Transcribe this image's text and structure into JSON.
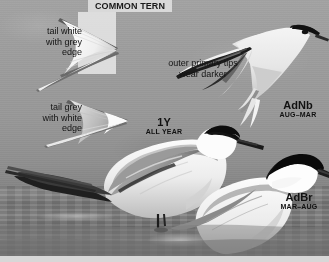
{
  "plate": {
    "title": "COMMON TERN",
    "subject": "Common Tern identification plate",
    "palette": {
      "sky": "#9d9d9d",
      "water": "#7a7a7a",
      "title_band": "#d9d9d9",
      "text": "#141414",
      "bottom_strip": "#d7d7d7"
    }
  },
  "annotations": [
    {
      "id": "tail-white-grey-edge",
      "text": "tail white\nwith grey\nedge",
      "align": "right"
    },
    {
      "id": "tail-grey-white-edge",
      "text": "tail grey\nwith white\nedge",
      "align": "right"
    },
    {
      "id": "outer-primary-tips",
      "text": "outer primary tips\nwear darker",
      "align": "center"
    }
  ],
  "bird_labels": [
    {
      "id": "adnb",
      "code": "AdNb",
      "season": "AUG–MAR",
      "pose": "flying"
    },
    {
      "id": "first-year",
      "code": "1Y",
      "season": "ALL YEAR",
      "pose": "standing"
    },
    {
      "id": "adbr",
      "code": "AdBr",
      "season": "MAR–AUG",
      "pose": "standing"
    }
  ]
}
